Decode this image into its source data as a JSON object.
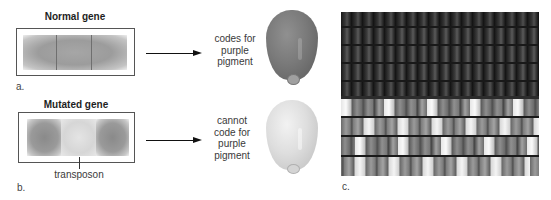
{
  "figure": {
    "panel_a": {
      "label": "a.",
      "title": "Normal gene",
      "gene_segments": [
        "exon",
        "exon",
        "exon"
      ],
      "caption_lines": [
        "codes for",
        "purple",
        "pigment"
      ],
      "kernel": "purple-kernel"
    },
    "panel_b": {
      "label": "b.",
      "title": "Mutated gene",
      "gene_segments": [
        "exon",
        "transposon",
        "exon"
      ],
      "insert_label": "transposon",
      "caption_lines": [
        "cannot",
        "code for",
        "purple",
        "pigment"
      ],
      "kernel": "white-kernel"
    },
    "panel_c": {
      "label": "c.",
      "photo": "ear-of-corn-purple-and-variegated-kernels"
    },
    "colors": {
      "background": "#ffffff",
      "box_border": "#555555",
      "gene_dark": "#8a8a8a",
      "transposon": "#dcdcdc",
      "purple_kernel": "#777777",
      "white_kernel": "#e0e0e0",
      "arrow": "#111111",
      "text": "#2a2a2a"
    }
  }
}
